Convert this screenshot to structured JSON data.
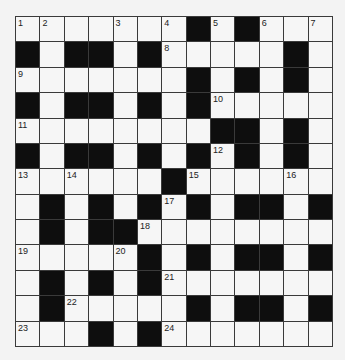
{
  "puzzle": {
    "rows": 13,
    "cols": 13,
    "colors": {
      "black": "#0e0e0e",
      "white": "#f6f6f6",
      "line": "#3a3a3a",
      "background": "#f3f3f3"
    },
    "grid": [
      "WWWWWWWBWBWWW",
      "BWBBWBWWWWWBW",
      "WWWWWWWBWBWBW",
      "BWBBWBWBWWWWW",
      "WWWWWWWWBBWBW",
      "BWBBWBWBWBWBW",
      "WWWWWWBWWWWWW",
      "WBWBWBWBWBBWB",
      "WBWBBWWWWWWWW",
      "WWWWWBWBWBBWB",
      "WBWBWBWWWWWWW",
      "WBWWWWWBWBBWB",
      "WWWBWBWWWWWWW"
    ],
    "numbers": [
      {
        "r": 0,
        "c": 0,
        "n": "1"
      },
      {
        "r": 0,
        "c": 1,
        "n": "2"
      },
      {
        "r": 0,
        "c": 4,
        "n": "3"
      },
      {
        "r": 0,
        "c": 6,
        "n": "4"
      },
      {
        "r": 0,
        "c": 8,
        "n": "5"
      },
      {
        "r": 0,
        "c": 10,
        "n": "6"
      },
      {
        "r": 0,
        "c": 12,
        "n": "7"
      },
      {
        "r": 1,
        "c": 6,
        "n": "8"
      },
      {
        "r": 2,
        "c": 0,
        "n": "9"
      },
      {
        "r": 3,
        "c": 8,
        "n": "10"
      },
      {
        "r": 4,
        "c": 0,
        "n": "11"
      },
      {
        "r": 5,
        "c": 8,
        "n": "12"
      },
      {
        "r": 6,
        "c": 0,
        "n": "13"
      },
      {
        "r": 6,
        "c": 2,
        "n": "14"
      },
      {
        "r": 6,
        "c": 7,
        "n": "15"
      },
      {
        "r": 6,
        "c": 11,
        "n": "16"
      },
      {
        "r": 7,
        "c": 6,
        "n": "17"
      },
      {
        "r": 8,
        "c": 5,
        "n": "18"
      },
      {
        "r": 9,
        "c": 0,
        "n": "19"
      },
      {
        "r": 9,
        "c": 4,
        "n": "20"
      },
      {
        "r": 10,
        "c": 6,
        "n": "21"
      },
      {
        "r": 11,
        "c": 2,
        "n": "22"
      },
      {
        "r": 12,
        "c": 0,
        "n": "23"
      },
      {
        "r": 12,
        "c": 6,
        "n": "24"
      }
    ]
  }
}
